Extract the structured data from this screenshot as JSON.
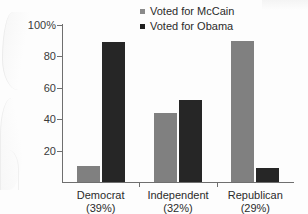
{
  "chart_data": {
    "type": "bar",
    "title": "",
    "xlabel": "",
    "ylabel": "",
    "ylim": [
      0,
      100
    ],
    "yticks": [
      0,
      20,
      40,
      60,
      80,
      100
    ],
    "ytick_labels": [
      "",
      "20",
      "40",
      "60",
      "80",
      "100%"
    ],
    "grid": false,
    "legend_position": "top-center",
    "categories": [
      "Democrat",
      "Independent",
      "Republican"
    ],
    "category_sublabels": [
      "(39%)",
      "(32%)",
      "(29%)"
    ],
    "series": [
      {
        "name": "Voted for McCain",
        "color": "#808080",
        "values": [
          10,
          44,
          90
        ]
      },
      {
        "name": "Voted for Obama",
        "color": "#262626",
        "values": [
          89,
          52,
          9
        ]
      }
    ]
  },
  "axis": {
    "y_labels": [
      {
        "value": 100,
        "text": "100%"
      },
      {
        "value": 80,
        "text": "80"
      },
      {
        "value": 60,
        "text": "60"
      },
      {
        "value": 40,
        "text": "40"
      },
      {
        "value": 20,
        "text": "20"
      }
    ]
  },
  "legend": {
    "items": [
      {
        "label": "Voted for McCain",
        "swatch": "mccain"
      },
      {
        "label": "Voted for Obama",
        "swatch": "obama"
      }
    ]
  }
}
